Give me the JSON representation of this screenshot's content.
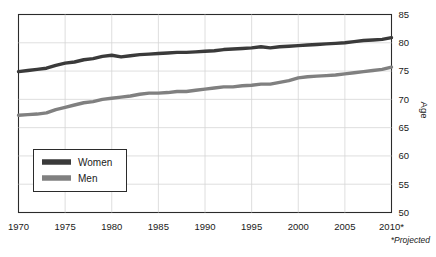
{
  "chart_data": {
    "type": "line",
    "title": "",
    "xlabel": "",
    "ylabel": "Age",
    "xlim": [
      1970,
      2010
    ],
    "ylim": [
      50,
      85
    ],
    "grid": true,
    "legend_position": "inside-lower-left",
    "x_tick_labels": [
      "1970",
      "1975",
      "1980",
      "1985",
      "1990",
      "1995",
      "2000",
      "2005",
      "2010*"
    ],
    "x_ticks": [
      1970,
      1975,
      1980,
      1985,
      1990,
      1995,
      2000,
      2005,
      2010
    ],
    "y_tick_labels": [
      "85",
      "80",
      "75",
      "70",
      "65",
      "60",
      "55",
      "50"
    ],
    "y_ticks": [
      85,
      80,
      75,
      70,
      65,
      60,
      55,
      50
    ],
    "y_axis_side": "right",
    "annotations": [
      "*Projected"
    ],
    "x": [
      1970,
      1971,
      1972,
      1973,
      1974,
      1975,
      1976,
      1977,
      1978,
      1979,
      1980,
      1981,
      1982,
      1983,
      1984,
      1985,
      1986,
      1987,
      1988,
      1989,
      1990,
      1991,
      1992,
      1993,
      1994,
      1995,
      1996,
      1997,
      1998,
      1999,
      2000,
      2001,
      2002,
      2003,
      2004,
      2005,
      2006,
      2007,
      2008,
      2009,
      2010
    ],
    "series": [
      {
        "name": "Women",
        "color": "#3a3a3a",
        "values": [
          74.9,
          75.1,
          75.3,
          75.5,
          76.0,
          76.4,
          76.6,
          77.0,
          77.2,
          77.6,
          77.8,
          77.5,
          77.7,
          77.9,
          78.0,
          78.1,
          78.2,
          78.3,
          78.3,
          78.4,
          78.5,
          78.6,
          78.8,
          78.9,
          79.0,
          79.1,
          79.3,
          79.1,
          79.3,
          79.4,
          79.5,
          79.6,
          79.7,
          79.8,
          79.9,
          80.0,
          80.2,
          80.4,
          80.5,
          80.6,
          80.9
        ]
      },
      {
        "name": "Men",
        "color": "#808080",
        "values": [
          67.2,
          67.3,
          67.4,
          67.6,
          68.2,
          68.6,
          69.0,
          69.4,
          69.6,
          70.0,
          70.2,
          70.4,
          70.6,
          70.9,
          71.1,
          71.1,
          71.2,
          71.4,
          71.4,
          71.6,
          71.8,
          72.0,
          72.2,
          72.2,
          72.4,
          72.5,
          72.7,
          72.7,
          73.0,
          73.3,
          73.8,
          74.0,
          74.1,
          74.2,
          74.3,
          74.5,
          74.7,
          74.9,
          75.1,
          75.3,
          75.7
        ]
      }
    ]
  },
  "legend": {
    "items": [
      {
        "label": "Women",
        "color": "#3a3a3a"
      },
      {
        "label": "Men",
        "color": "#808080"
      }
    ]
  },
  "axis": {
    "y_title": "Age"
  },
  "footnote": {
    "text": "*Projected"
  }
}
